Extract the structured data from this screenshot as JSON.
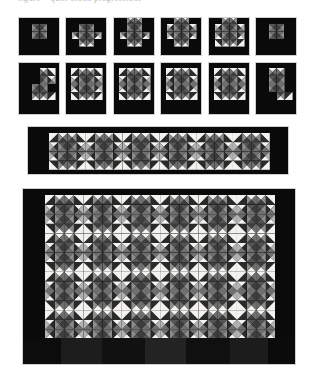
{
  "page": {
    "background_color": "#ffffff",
    "width": 316,
    "height": 372,
    "caption_text": "figure – quilt block progressions"
  },
  "palette": {
    "background": "#0a0a0a",
    "very_dark": "#141414",
    "dark": "#2a2a2a",
    "dark_gray": "#3d3d3d",
    "mid_dark": "#545454",
    "mid": "#6f6f6f",
    "mid_light": "#8d8d8d",
    "light_gray": "#b2b2b2",
    "pale": "#d6d6d6",
    "white": "#f3f2ee",
    "frame": "#cfcfcf",
    "seam": "#9a9a9a"
  },
  "sections": [
    {
      "id": "row-one",
      "name": "top-block-row",
      "label": "Row 1 — single block progression",
      "x": 18,
      "y": 17,
      "width": 279,
      "height": 39,
      "panel_count": 6,
      "panel_width": 42,
      "panel_height": 39,
      "panel_gap": 5.4,
      "block_grid": "4x4",
      "note": "Small rectangular panels, each showing a partially pieced pinwheel unit on black ground"
    },
    {
      "id": "row-two",
      "name": "second-block-row",
      "label": "Row 2 — completed star blocks",
      "x": 18,
      "y": 62,
      "width": 279,
      "height": 53,
      "panel_count": 6,
      "panel_width": 42,
      "panel_height": 53,
      "panel_gap": 5.4,
      "block_grid": "4x4",
      "note": "Six square panels showing the finished eight-point star block"
    },
    {
      "id": "row-three",
      "name": "border-strip-panel",
      "label": "Row 3 — horizontal border strip",
      "x": 27,
      "y": 126,
      "width": 262,
      "height": 49,
      "blocks_across": 6,
      "blocks_down": 1,
      "note": "A single long strip of six joined blocks framed by black border"
    },
    {
      "id": "row-four",
      "name": "full-quilt-panel",
      "label": "Row 4 — complete quilt top",
      "x": 22,
      "y": 188,
      "width": 274,
      "height": 177,
      "blocks_across": 6,
      "blocks_down": 4,
      "note": "Full quilt layout, six blocks wide by four blocks tall with dark outer border"
    }
  ],
  "chart_data": {
    "type": "heatmap",
    "xlabel": "block column",
    "ylabel": "block row",
    "grid": true,
    "legend": "none",
    "unit_tone_scale": [
      "very_dark",
      "dark",
      "dark_gray",
      "mid_dark",
      "mid",
      "mid_light",
      "light_gray",
      "pale",
      "white"
    ]
  },
  "block_definitions": {
    "comment": "Each block is a 4x4 grid of 16 units. Each unit is described by type and the tones of its triangles, read left-to-right, top-to-bottom.",
    "star_block": [
      {
        "t": "hst",
        "d": "tl",
        "a": "white",
        "b": "dark"
      },
      {
        "t": "qst",
        "n": "white",
        "e": "mid",
        "s": "dark_gray",
        "w": "mid_light"
      },
      {
        "t": "qst",
        "n": "white",
        "e": "mid_light",
        "s": "dark_gray",
        "w": "mid"
      },
      {
        "t": "hst",
        "d": "tr",
        "a": "white",
        "b": "dark"
      },
      {
        "t": "qst",
        "n": "white",
        "e": "dark",
        "s": "mid",
        "w": "light_gray"
      },
      {
        "t": "qst",
        "n": "mid_dark",
        "e": "dark_gray",
        "s": "mid",
        "w": "mid_light"
      },
      {
        "t": "qst",
        "n": "mid_dark",
        "e": "mid_light",
        "s": "mid",
        "w": "dark_gray"
      },
      {
        "t": "qst",
        "n": "white",
        "e": "light_gray",
        "s": "mid",
        "w": "dark"
      },
      {
        "t": "qst",
        "n": "mid",
        "e": "dark",
        "s": "white",
        "w": "light_gray"
      },
      {
        "t": "qst",
        "n": "mid",
        "e": "dark_gray",
        "s": "mid_dark",
        "w": "mid_light"
      },
      {
        "t": "qst",
        "n": "mid",
        "e": "mid_light",
        "s": "mid_dark",
        "w": "dark_gray"
      },
      {
        "t": "qst",
        "n": "mid",
        "e": "light_gray",
        "s": "white",
        "w": "dark"
      },
      {
        "t": "hst",
        "d": "bl",
        "a": "white",
        "b": "dark"
      },
      {
        "t": "qst",
        "n": "dark_gray",
        "e": "mid",
        "s": "white",
        "w": "mid_light"
      },
      {
        "t": "qst",
        "n": "dark_gray",
        "e": "mid_light",
        "s": "white",
        "w": "mid"
      },
      {
        "t": "hst",
        "d": "br",
        "a": "white",
        "b": "dark"
      }
    ]
  },
  "progression_stages": [
    {
      "stage": 1,
      "label": "center pinwheel only",
      "units_filled": 4
    },
    {
      "stage": 2,
      "label": "pinwheel plus lower points",
      "units_filled": 7
    },
    {
      "stage": 3,
      "label": "pinwheel, points and side wings",
      "units_filled": 9
    },
    {
      "stage": 4,
      "label": "three quarters pieced",
      "units_filled": 11
    },
    {
      "stage": 5,
      "label": "nearly complete",
      "units_filled": 13
    },
    {
      "stage": 6,
      "label": "single rotated unit",
      "units_filled": 4
    }
  ]
}
